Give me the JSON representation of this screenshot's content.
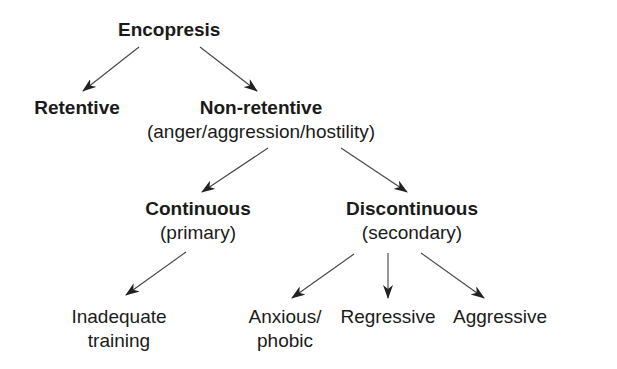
{
  "diagram": {
    "type": "tree",
    "nodes": {
      "root": {
        "label": "Encopresis"
      },
      "retentive": {
        "label": "Retentive"
      },
      "non_retentive": {
        "label": "Non-retentive",
        "sublabel": "(anger/aggression/hostility)"
      },
      "continuous": {
        "label": "Continuous",
        "sublabel": "(primary)"
      },
      "discontinuous": {
        "label": "Discontinuous",
        "sublabel": "(secondary)"
      },
      "inadequate": {
        "line1": "Inadequate",
        "line2": "training"
      },
      "anxious": {
        "line1": "Anxious/",
        "line2": "phobic"
      },
      "regressive": {
        "label": "Regressive"
      },
      "aggressive": {
        "label": "Aggressive"
      }
    },
    "edges": [
      [
        "Encopresis",
        "Retentive"
      ],
      [
        "Encopresis",
        "Non-retentive"
      ],
      [
        "Non-retentive",
        "Continuous"
      ],
      [
        "Non-retentive",
        "Discontinuous"
      ],
      [
        "Continuous",
        "Inadequate training"
      ],
      [
        "Discontinuous",
        "Anxious/phobic"
      ],
      [
        "Discontinuous",
        "Regressive"
      ],
      [
        "Discontinuous",
        "Aggressive"
      ]
    ],
    "colors": {
      "text": "#1a1a1a",
      "arrow": "#333333",
      "background": "#ffffff"
    }
  }
}
